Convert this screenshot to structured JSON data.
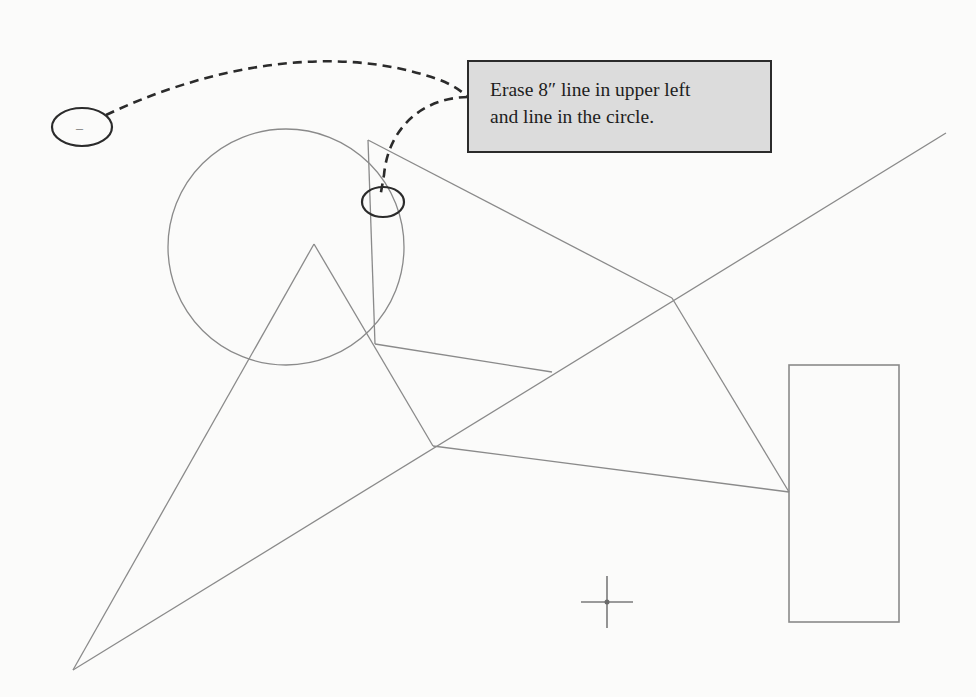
{
  "callout": {
    "line1": "Erase 8″ line in upper left",
    "line2": "and line in the circle."
  },
  "colors": {
    "background": "#fbfbfa",
    "drawing_line": "#8a8a8a",
    "annotation": "#2b2b2b",
    "callout_fill": "#dcdcdc"
  },
  "drawing": {
    "circle": {
      "cx": 286,
      "cy": 247,
      "r": 118
    },
    "lines": [
      {
        "id": "vertical-in-circle",
        "x1": 368,
        "y1": 140,
        "x2": 375,
        "y2": 344
      },
      {
        "id": "circle-top-to-junction",
        "x1": 368,
        "y1": 140,
        "x2": 672,
        "y2": 298
      },
      {
        "id": "triangle-left-leg",
        "x1": 314,
        "y1": 244,
        "x2": 73,
        "y2": 670
      },
      {
        "id": "triangle-right-leg",
        "x1": 314,
        "y1": 244,
        "x2": 433,
        "y2": 446
      },
      {
        "id": "long-diagonal",
        "x1": 73,
        "y1": 670,
        "x2": 946,
        "y2": 133
      },
      {
        "id": "center-to-diagonal",
        "x1": 375,
        "y1": 344,
        "x2": 552,
        "y2": 372
      },
      {
        "id": "junction-to-rectangle",
        "x1": 672,
        "y1": 298,
        "x2": 789,
        "y2": 492
      },
      {
        "id": "lower-vertex-to-rectangle",
        "x1": 433,
        "y1": 446,
        "x2": 789,
        "y2": 492
      }
    ],
    "rectangle": {
      "x": 789,
      "y": 365,
      "width": 110,
      "height": 257
    },
    "crosshair": {
      "x": 607,
      "y": 602,
      "arm": 26
    },
    "annotation_ellipses": [
      {
        "id": "upper-left-ellipse",
        "cx": 82,
        "cy": 127,
        "rx": 30,
        "ry": 19,
        "mark": "–"
      },
      {
        "id": "circle-line-ellipse",
        "cx": 383,
        "cy": 202,
        "rx": 21,
        "ry": 15
      }
    ]
  }
}
